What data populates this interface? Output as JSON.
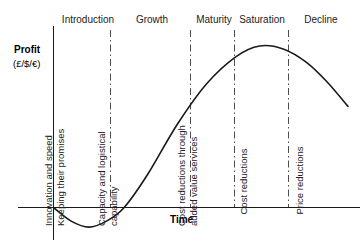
{
  "chart_data": {
    "type": "line",
    "title": "",
    "xlabel": "Time",
    "ylabel": "Profit",
    "ylabel_units": "(£/$/€)",
    "grid": false,
    "legend": "none",
    "axis_zero_line": true,
    "stages": [
      {
        "label": "Introduction",
        "note": "Innovation and speed\nKeeping their promises"
      },
      {
        "label": "Growth",
        "note": "Capacity and logistical capability"
      },
      {
        "label": "Maturity",
        "note": "Cost reductions through added value services"
      },
      {
        "label": "Saturation",
        "note": "Cost reductions"
      },
      {
        "label": "Decline",
        "note": "Price reductions"
      }
    ],
    "series": [
      {
        "name": "Profit",
        "description": "S-curve product life cycle: initial loss dip below zero, steep growth, peak at maturity/saturation boundary, then decline",
        "points": [
          {
            "x": 0,
            "y": 0
          },
          {
            "x": 6,
            "y": -9
          },
          {
            "x": 12,
            "y": -13
          },
          {
            "x": 18,
            "y": -9
          },
          {
            "x": 24,
            "y": 0
          },
          {
            "x": 32,
            "y": 22
          },
          {
            "x": 42,
            "y": 55
          },
          {
            "x": 52,
            "y": 82
          },
          {
            "x": 62,
            "y": 100
          },
          {
            "x": 70,
            "y": 107
          },
          {
            "x": 78,
            "y": 105
          },
          {
            "x": 86,
            "y": 96
          },
          {
            "x": 93,
            "y": 83
          },
          {
            "x": 100,
            "y": 67
          }
        ]
      }
    ]
  },
  "labels": {
    "stage_introduction": "Introduction",
    "stage_growth": "Growth",
    "stage_maturity": "Maturity",
    "stage_saturation": "Saturation",
    "stage_decline": "Decline",
    "y_axis_title": "Profit",
    "y_axis_units": "(£/$/€)",
    "x_axis_title": "Time",
    "note_introduction_line1": "Innovation and speed",
    "note_introduction_line2": "Keeping their promises",
    "note_growth_line1": "Capacity and logistical",
    "note_growth_line2": "capability",
    "note_maturity_line1": "Cost reductions through",
    "note_maturity_line2": "added value services",
    "note_saturation_line1": "Cost reductions",
    "note_decline_line1": "Price reductions"
  },
  "colors": {
    "curve": "#1a1a1a",
    "axis": "#1a1a1a",
    "divider": "#3a3a3a",
    "text": "#222222"
  }
}
